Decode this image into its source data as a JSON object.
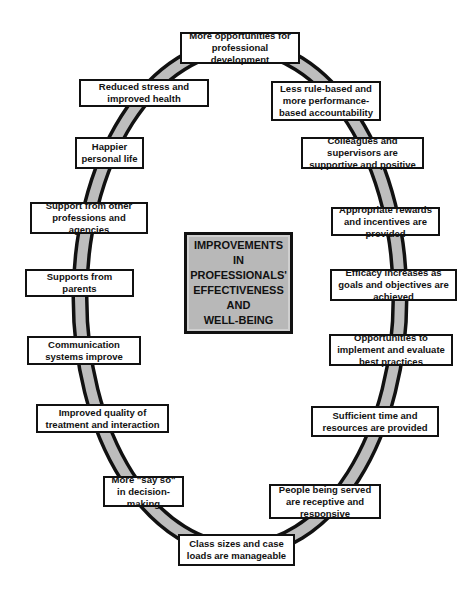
{
  "diagram": {
    "center_label": "IMPROVEMENTS\nIN\nPROFESSIONALS'\nEFFECTIVENESS\nAND\nWELL-BEING",
    "ring_color": "#bdbdbd",
    "nodes": [
      {
        "id": "top",
        "label": "More opportunities for professional development",
        "x": 180,
        "y": 32,
        "w": 120,
        "h": 32
      },
      {
        "id": "reduced-stress",
        "label": "Reduced stress and improved health",
        "x": 79,
        "y": 79,
        "w": 130,
        "h": 28
      },
      {
        "id": "less-rule",
        "label": "Less rule-based and more performance-based accountability",
        "x": 271,
        "y": 81,
        "w": 110,
        "h": 40
      },
      {
        "id": "happier",
        "label": "Happier personal life",
        "x": 75,
        "y": 137,
        "w": 69,
        "h": 32
      },
      {
        "id": "colleagues",
        "label": "Colleagues and supervisors are supportive and positive",
        "x": 301,
        "y": 137,
        "w": 123,
        "h": 32
      },
      {
        "id": "support-other",
        "label": "Support from other professions and agencies",
        "x": 30,
        "y": 202,
        "w": 118,
        "h": 32
      },
      {
        "id": "rewards",
        "label": "Appropriate rewards and incentives are provided",
        "x": 331,
        "y": 207,
        "w": 109,
        "h": 29
      },
      {
        "id": "parents",
        "label": "Supports from parents",
        "x": 25,
        "y": 269,
        "w": 109,
        "h": 28
      },
      {
        "id": "efficacy",
        "label": "Efficacy increases as goals and objectives are achieved",
        "x": 330,
        "y": 269,
        "w": 127,
        "h": 32
      },
      {
        "id": "communication",
        "label": "Communication systems improve",
        "x": 27,
        "y": 336,
        "w": 114,
        "h": 29
      },
      {
        "id": "best-practices",
        "label": "Opportunities to implement and evaluate best practices",
        "x": 329,
        "y": 334,
        "w": 124,
        "h": 32
      },
      {
        "id": "quality",
        "label": "Improved quality of treatment and interaction",
        "x": 36,
        "y": 404,
        "w": 133,
        "h": 29
      },
      {
        "id": "time",
        "label": "Sufficient time and resources are provided",
        "x": 311,
        "y": 406,
        "w": 128,
        "h": 31
      },
      {
        "id": "say-so",
        "label": "More \"say so\" in decision-making",
        "x": 103,
        "y": 476,
        "w": 81,
        "h": 31
      },
      {
        "id": "people-served",
        "label": "People being served are receptive and responsive",
        "x": 269,
        "y": 484,
        "w": 112,
        "h": 35
      },
      {
        "id": "class-sizes",
        "label": "Class sizes and case loads are manageable",
        "x": 178,
        "y": 534,
        "w": 117,
        "h": 32
      }
    ]
  }
}
